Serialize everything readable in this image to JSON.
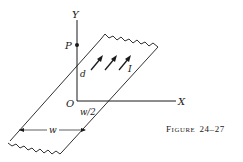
{
  "figure": {
    "caption_prefix": "F",
    "caption_smallcaps": "IGURE",
    "caption_number": "24–27",
    "caption_full": "Figure 24–27"
  },
  "labels": {
    "x_axis": "X",
    "y_axis": "Y",
    "origin": "O",
    "point": "P",
    "distance": "d",
    "half_width": "w/2",
    "width": "w",
    "current": "I"
  },
  "colors": {
    "ink": "#1a1a1a",
    "background": "#ffffff"
  },
  "elements": {
    "strip": "infinitely long thin conducting strip carrying current I, width w, lying in plane",
    "point_P": "on Y axis at distance d from origin",
    "arrows": 3
  }
}
